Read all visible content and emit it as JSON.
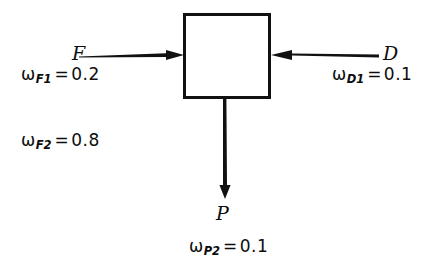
{
  "figure": {
    "type": "process-block-flow-diagram",
    "background_color": "#ffffff",
    "line_color": "#111111",
    "unit": {
      "shape": "rectangle",
      "label": ""
    }
  },
  "streams": {
    "feed": {
      "letter": "F",
      "direction": "right",
      "role": "inlet-left",
      "compositions": [
        {
          "id": "wF1",
          "symbol": "ω",
          "subscript": "F1",
          "equals": "=",
          "value": "0.2"
        },
        {
          "id": "wF2",
          "symbol": "ω",
          "subscript": "F2",
          "equals": "=",
          "value": "0.8"
        }
      ]
    },
    "diluent": {
      "letter": "D",
      "direction": "left",
      "role": "inlet-right",
      "compositions": [
        {
          "id": "wD1",
          "symbol": "ω",
          "subscript": "D1",
          "equals": "=",
          "value": "0.1"
        }
      ]
    },
    "product": {
      "letter": "P",
      "direction": "down",
      "role": "outlet-bottom",
      "compositions": [
        {
          "id": "wP2",
          "symbol": "ω",
          "subscript": "P2",
          "equals": "=",
          "value": "0.1"
        }
      ]
    }
  }
}
